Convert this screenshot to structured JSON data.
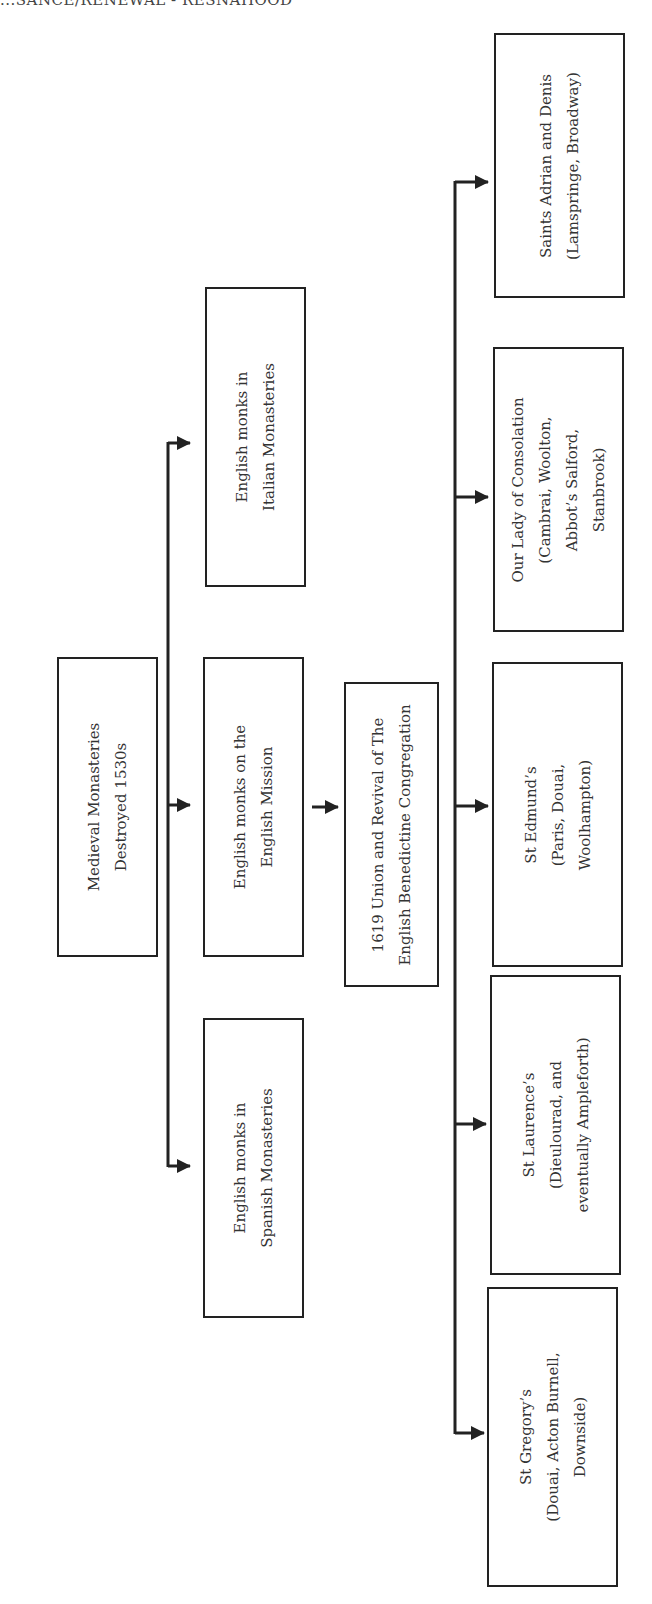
{
  "header": {
    "text": "...SANCE/RENEWAL - RESNAHOOD"
  },
  "diagram": {
    "type": "tree",
    "orientation": "rotated-90-ccw",
    "nodes": {
      "root": {
        "label": "Medieval Monasteries\nDestroyed 1530s"
      },
      "italian": {
        "label": "English monks in\nItalian Monasteries"
      },
      "mission": {
        "label": "English monks on the\nEnglish Mission"
      },
      "spanish": {
        "label": "English monks in\nSpanish Monasteries"
      },
      "union": {
        "label": "1619 Union and Revival of The\nEnglish Benedictine Congregation"
      },
      "adrian": {
        "label": "Saints Adrian and Denis\n(Lamspringe, Broadway)"
      },
      "consolation": {
        "label": "Our Lady of Consolation\n(Cambrai, Woolton,\nAbbot’s Salford,\nStanbrook)"
      },
      "edmund": {
        "label": "St Edmund’s\n(Paris, Douai,\nWoolhampton)"
      },
      "laurence": {
        "label": "St Laurence’s\n(Dieulourad, and\neventually Ampleforth)"
      },
      "gregory": {
        "label": "St Gregory’s\n(Douai, Acton Burnell,\nDownside)"
      }
    },
    "edges": [
      [
        "root",
        "italian"
      ],
      [
        "root",
        "mission"
      ],
      [
        "root",
        "spanish"
      ],
      [
        "mission",
        "union"
      ],
      [
        "union",
        "adrian"
      ],
      [
        "union",
        "consolation"
      ],
      [
        "union",
        "edmund"
      ],
      [
        "union",
        "laurence"
      ],
      [
        "union",
        "gregory"
      ]
    ],
    "colors": {
      "line": "#222222",
      "text": "#333333",
      "background": "#ffffff"
    }
  }
}
